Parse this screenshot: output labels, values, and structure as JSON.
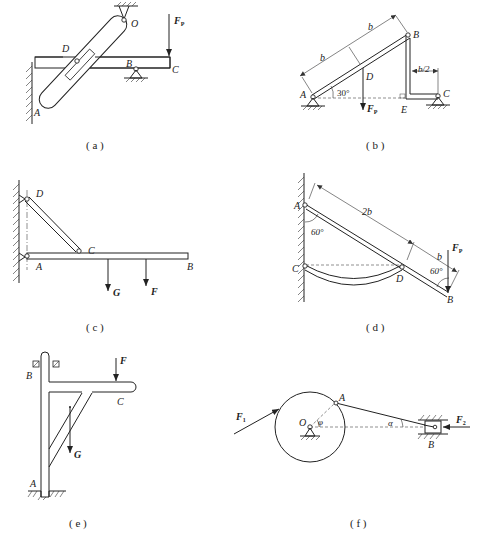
{
  "figure": {
    "panels": [
      {
        "id": "a",
        "caption": "( a )",
        "labels": {
          "O": "O",
          "D": "D",
          "B": "B",
          "C": "C",
          "A": "A",
          "force": "F",
          "force_sub": "P"
        }
      },
      {
        "id": "b",
        "caption": "( b )",
        "labels": {
          "A": "A",
          "B": "B",
          "C": "C",
          "D": "D",
          "E": "E",
          "force": "F",
          "force_sub": "P",
          "dim1": "b",
          "dim2": "b",
          "dim3": "b/2",
          "angle": "30°"
        }
      },
      {
        "id": "c",
        "caption": "( c )",
        "labels": {
          "D": "D",
          "C": "C",
          "A": "A",
          "B": "B",
          "G": "G",
          "F": "F"
        }
      },
      {
        "id": "d",
        "caption": "( d )",
        "labels": {
          "A": "A",
          "C": "C",
          "D": "D",
          "B": "B",
          "force": "F",
          "force_sub": "P",
          "dim1": "2b",
          "dim2": "b",
          "angle1": "60°",
          "angle2": "60°"
        }
      },
      {
        "id": "e",
        "caption": "( e )",
        "labels": {
          "B": "B",
          "C": "C",
          "A": "A",
          "F": "F",
          "G": "G"
        }
      },
      {
        "id": "f",
        "caption": "( f )",
        "labels": {
          "O": "O",
          "A": "A",
          "B": "B",
          "F1": "F",
          "F1_sub": "1",
          "F2": "F",
          "F2_sub": "2",
          "phi": "φ",
          "alpha": "α"
        }
      }
    ]
  }
}
